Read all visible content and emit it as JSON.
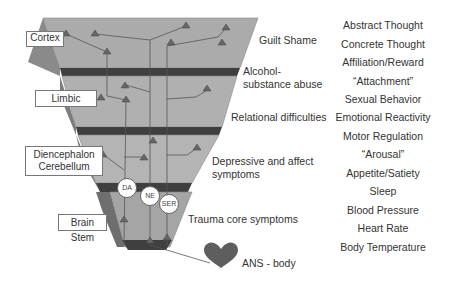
{
  "brain_layers": [
    {
      "label": "Cortex"
    },
    {
      "label": "Limbic"
    },
    {
      "label": "Diencephalon\nCerebellum",
      "line1": "Diencephalon",
      "line2": "Cerebellum"
    },
    {
      "label": "Brain Stem"
    }
  ],
  "neurotransmitters": [
    "DA",
    "NE",
    "SER"
  ],
  "symptoms": [
    {
      "text": "Guilt Shame"
    },
    {
      "text": "Alcohol-",
      "text2": "substance abuse"
    },
    {
      "text": "Relational difficulties"
    },
    {
      "text": "Depressive and affect",
      "text2": "symptoms"
    },
    {
      "text": "Trauma core symptoms"
    }
  ],
  "body": {
    "label": "ANS - body",
    "icon": "heart-icon"
  },
  "functions": [
    "Abstract Thought",
    "Concrete Thought",
    "Affiliation/Reward",
    "“Attachment”",
    "Sexual Behavior",
    "Emotional Reactivity",
    "Motor Regulation",
    "“Arousal”",
    "Appetite/Satiety",
    "Sleep",
    "Blood Pressure",
    "Heart Rate",
    "Body Temperature"
  ],
  "colors": {
    "layer_face": "#a9a9a9",
    "layer_side": "#7a7a7a",
    "band": "#3f3f3f",
    "neuron": "#6a6a6a",
    "heart": "#5e5e5e"
  }
}
